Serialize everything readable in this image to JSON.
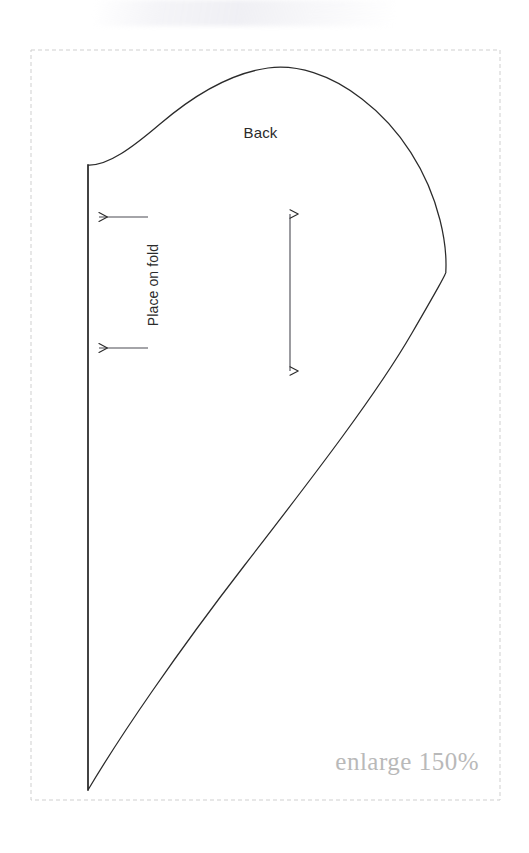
{
  "document": {
    "type": "sewing-pattern-piece",
    "background_color": "#ffffff"
  },
  "pattern": {
    "piece_label": "Back",
    "fold_label": "Place on fold",
    "scale_note": "enlarge 150%",
    "line_color": "#2b2b2b",
    "cut_border_color": "#cfcfcf",
    "note_color": "#b9b9b9",
    "cut_border": {
      "x": 31,
      "y": 50,
      "width": 469,
      "height": 750,
      "style": "dashed"
    },
    "outline": {
      "fold_edge": {
        "x": 88,
        "y_top": 165,
        "y_bottom": 790
      },
      "apex": {
        "x": 260,
        "y": 68
      },
      "widest": {
        "x": 446,
        "y": 285
      },
      "tip": {
        "x": 88,
        "y": 790
      },
      "path": "M 88 165 L 88 790 C 150 700 300 520 396 390 C 440 330 449 305 446 277 C 441 212 380 120 300 80 C 272 66 243 64 218 74 C 178 90 130 126 88 165 Z"
    },
    "grainline": {
      "x": 290,
      "y_top": 207,
      "y_bottom": 378,
      "double_headed": true
    },
    "fold_arrows": [
      {
        "y": 217,
        "x_tail": 148,
        "x_head": 95,
        "direction": "left"
      },
      {
        "y": 348,
        "x_tail": 148,
        "x_head": 95,
        "direction": "left"
      }
    ]
  }
}
